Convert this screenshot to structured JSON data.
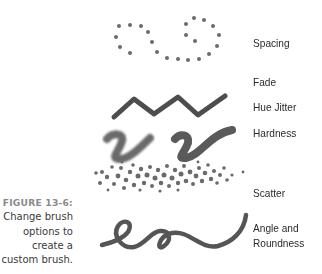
{
  "figure": {
    "number_label": "FIGURE 13-6:",
    "caption_lines": [
      "Change brush",
      "options to",
      "create a",
      "custom brush."
    ]
  },
  "brush_options": [
    {
      "label": "Spacing",
      "icon": "dotted-loop-stroke"
    },
    {
      "label": "Fade",
      "icon": "fading-line-stroke"
    },
    {
      "label": "Hue Jitter",
      "icon": "zigzag-stroke"
    },
    {
      "label": "Hardness",
      "icon": "soft-and-hard-v-strokes"
    },
    {
      "label": "Scatter",
      "icon": "scattered-dots-stroke"
    },
    {
      "label": "Angle and",
      "label_line2": "Roundness",
      "icon": "calligraphic-loop-stroke"
    }
  ],
  "colors": {
    "stroke": "#5e5e5e",
    "text": "#2a2a2a",
    "figure_label": "#8a8a8a"
  }
}
